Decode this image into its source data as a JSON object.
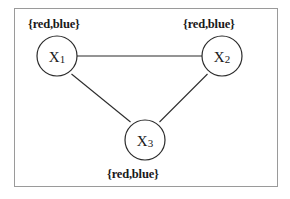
{
  "figure": {
    "type": "constraint-graph",
    "background_color": "#ffffff",
    "frame_color": "#9a9a9a",
    "stroke_color": "#2b2b2b",
    "text_color": "#1a1a1a"
  },
  "nodes": [
    {
      "id": "x1",
      "name": "X",
      "subscript": "1",
      "domain_label": "{red,blue}",
      "cx": 57,
      "cy": 56,
      "r": 20
    },
    {
      "id": "x2",
      "name": "X",
      "subscript": "2",
      "domain_label": "{red,blue}",
      "cx": 222,
      "cy": 56,
      "r": 20
    },
    {
      "id": "x3",
      "name": "X",
      "subscript": "3",
      "domain_label": "{red,blue}",
      "cx": 145,
      "cy": 140,
      "r": 20
    }
  ],
  "edges": [
    {
      "id": "x1-x2",
      "from": "x1",
      "to": "x2"
    },
    {
      "id": "x1-x3",
      "from": "x1",
      "to": "x3"
    },
    {
      "id": "x2-x3",
      "from": "x2",
      "to": "x3"
    }
  ]
}
